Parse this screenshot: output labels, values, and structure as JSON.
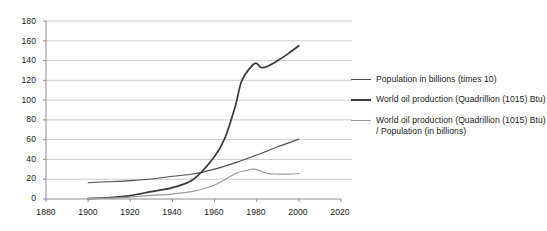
{
  "chart_data": {
    "type": "line",
    "title": "",
    "subtitle": "",
    "xlabel": "",
    "ylabel": "",
    "xlim": [
      1880,
      2020
    ],
    "ylim": [
      0,
      180
    ],
    "xticks": [
      1880,
      1900,
      1920,
      1940,
      1960,
      1980,
      2000,
      2020
    ],
    "yticks": [
      0,
      20,
      40,
      60,
      80,
      100,
      120,
      140,
      160,
      180
    ],
    "grid": "horizontal",
    "legend_position": "right",
    "background": "#ffffff",
    "grid_color": "#b8b8c0",
    "axis_color": "#808088",
    "series": [
      {
        "name": "Population in billions (times 10)",
        "color": "#4d4d4d",
        "width": 1.1,
        "x": [
          1900,
          1910,
          1920,
          1930,
          1940,
          1950,
          1960,
          1970,
          1980,
          1990,
          2000
        ],
        "values": [
          16.5,
          17.5,
          18.6,
          20.3,
          23.0,
          25.3,
          30.2,
          36.8,
          44.5,
          52.8,
          60.5
        ]
      },
      {
        "name": "World oil production (Quadrillion (1015) Btu)",
        "color": "#3a3a3a",
        "width": 1.7,
        "x": [
          1900,
          1910,
          1920,
          1930,
          1940,
          1950,
          1960,
          1965,
          1970,
          1973,
          1979,
          1982,
          1985,
          1990,
          1995,
          2000
        ],
        "values": [
          0.5,
          1.5,
          3.5,
          7.5,
          11.5,
          20.0,
          43.0,
          62.0,
          95.0,
          120.0,
          137.0,
          133.0,
          134.0,
          140.0,
          147.0,
          155.0
        ]
      },
      {
        "name": "World oil production (Quadrillion (1015) Btu) / Population (in billions)",
        "color": "#9a9a9a",
        "width": 1.2,
        "x": [
          1900,
          1910,
          1920,
          1930,
          1940,
          1950,
          1960,
          1970,
          1975,
          1979,
          1985,
          1990,
          1995,
          2000
        ],
        "values": [
          0.3,
          0.9,
          1.9,
          3.7,
          5.0,
          7.9,
          14.2,
          25.8,
          28.8,
          30.2,
          26.0,
          25.2,
          25.2,
          25.6
        ]
      }
    ]
  },
  "legend": {
    "entries": [
      {
        "label": "Population in billions (times 10)"
      },
      {
        "label": "World oil production (Quadrillion (1015) Btu)"
      },
      {
        "label": "World oil production (Quadrillion (1015) Btu) / Population (in billions)"
      }
    ]
  },
  "axes": {
    "y_tick_labels": [
      "180",
      "160",
      "140",
      "120",
      "100",
      "80",
      "60",
      "40",
      "20",
      "0"
    ],
    "x_tick_labels": [
      "1880",
      "1900",
      "1920",
      "1940",
      "1960",
      "1980",
      "2000",
      "2020"
    ]
  }
}
